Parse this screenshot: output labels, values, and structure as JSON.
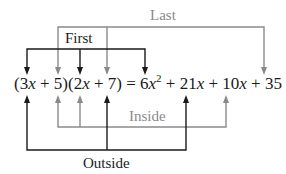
{
  "labels": {
    "last": "Last",
    "first": "First",
    "inside": "Inside",
    "outside": "Outside"
  },
  "equation": {
    "p1": "(3",
    "x1": "x",
    "p2": " + 5)(2",
    "x2": "x",
    "p3": " + 7) = 6",
    "x3": "x",
    "sup": "2",
    "p4": " + 21",
    "x4": "x",
    "p5": " + 10",
    "x5": "x",
    "p6": " + 35"
  },
  "colors": {
    "black": "#1a1a1a",
    "gray": "#8a8a8a"
  }
}
